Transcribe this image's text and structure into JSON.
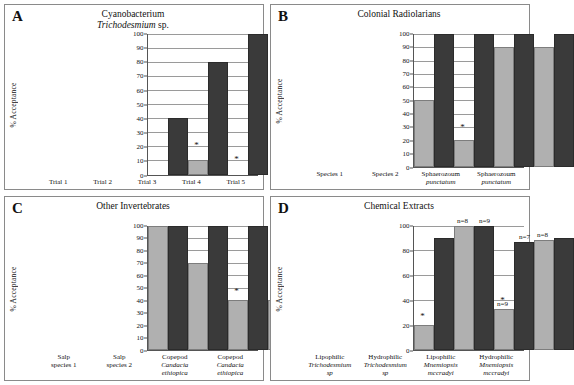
{
  "figure": {
    "panels": [
      {
        "letter": "A",
        "title_line1": "Cyanobacterium",
        "title_line2_italic": "Trichodesmium",
        "title_line2_rest": " sp.",
        "ylabel": "% Acceptance",
        "yticks": [
          0,
          10,
          20,
          30,
          40,
          50,
          60,
          70,
          80,
          90,
          100
        ],
        "categories": [
          "Trial 1",
          "Trial 2",
          "Trial 3",
          "Trial 4",
          "Trial 5"
        ],
        "light_values": [
          0,
          10,
          0,
          0,
          0
        ],
        "dark_values": [
          40,
          80,
          100,
          100,
          100
        ],
        "star_on_light": [
          false,
          true,
          true,
          true,
          true
        ],
        "star_heights": [
          0,
          18,
          8,
          8,
          8
        ]
      },
      {
        "letter": "B",
        "title_line1": "Colonial Radiolarians",
        "title_line2_italic": "",
        "title_line2_rest": "",
        "ylabel": "% Acceptance",
        "yticks": [
          0,
          10,
          20,
          30,
          40,
          50,
          60,
          70,
          80,
          90,
          100
        ],
        "categories": [
          "Species 1",
          "Species 2",
          "Sphaerozoum punctatum",
          "Sphaerozoum punctatum"
        ],
        "cat_lines": [
          {
            "l1": "Species 1",
            "l2": "",
            "italic": false
          },
          {
            "l1": "Species 2",
            "l2": "",
            "italic": false
          },
          {
            "l1": "Sphaerozoum",
            "l2": "punctatum",
            "italic": true
          },
          {
            "l1": "Sphaerozoum",
            "l2": "punctatum",
            "italic": true
          }
        ],
        "light_values": [
          50,
          20,
          90,
          90
        ],
        "dark_values": [
          100,
          100,
          100,
          100
        ],
        "star_on_light": [
          false,
          true,
          false,
          false
        ],
        "star_heights": [
          0,
          27,
          0,
          0
        ]
      },
      {
        "letter": "C",
        "title_line1": "Other Invertebrates",
        "title_line2_italic": "",
        "title_line2_rest": "",
        "ylabel": "% Acceptance",
        "yticks": [
          0,
          10,
          20,
          30,
          40,
          50,
          60,
          70,
          80,
          90,
          100
        ],
        "categories": [
          "Salp species 1",
          "Salp species 2",
          "Copepod Candacia ethiopica",
          "Copepod Candacia ethiopica"
        ],
        "cat_lines": [
          {
            "l1": "Salp",
            "l2": "species 1",
            "l3": "",
            "italic": false
          },
          {
            "l1": "Salp",
            "l2": "species 2",
            "l3": "",
            "italic": false
          },
          {
            "l1": "Copepod",
            "l2": "Candacia",
            "l3": "ethiopica",
            "italic": true
          },
          {
            "l1": "Copepod",
            "l2": "Candacia",
            "l3": "ethiopica",
            "italic": true
          }
        ],
        "light_values": [
          100,
          70,
          40,
          40
        ],
        "dark_values": [
          100,
          100,
          100,
          80
        ],
        "star_on_light": [
          false,
          false,
          true,
          true
        ],
        "star_heights": [
          0,
          0,
          44,
          44
        ]
      },
      {
        "letter": "D",
        "title_line1": "Chemical Extracts",
        "title_line2_italic": "",
        "title_line2_rest": "",
        "ylabel": "% Acceptance",
        "yticks": [
          0,
          20,
          40,
          60,
          80,
          100
        ],
        "categories": [
          "Lipophilic Trichodesmium sp",
          "Hydrophilic Trichodesmium sp",
          "Lipophilic Mnemiopsis mccradyi",
          "Hydrophilic Mnemiopsis mccradyi"
        ],
        "cat_lines": [
          {
            "l1": "Lipophilic",
            "l2": "Trichodesmium",
            "l3": "sp",
            "italic": true
          },
          {
            "l1": "Hydrophilic",
            "l2": "Trichodesmium",
            "l3": "sp",
            "italic": true
          },
          {
            "l1": "Lipophilic",
            "l2": "Mnemiopsis",
            "l3": "mccradyi",
            "italic": true
          },
          {
            "l1": "Hydrophilic",
            "l2": "Mnemiopsis",
            "l3": "mccradyi",
            "italic": true
          }
        ],
        "light_values": [
          20,
          100,
          33,
          88
        ],
        "dark_values": [
          90,
          100,
          87,
          90
        ],
        "star_on_light": [
          true,
          false,
          true,
          false
        ],
        "star_heights": [
          24,
          0,
          37,
          0
        ],
        "n_light": [
          "",
          "n=8",
          "n=9",
          "n=8"
        ],
        "n_dark": [
          "",
          "n=9",
          "n=7",
          ""
        ]
      }
    ],
    "colors": {
      "light_bar": "#b0b0b0",
      "dark_bar": "#3a3a3a",
      "gridline": "#9a9a9a",
      "axis": "#555555",
      "panel_border": "#8a8a8a",
      "background": "#ffffff"
    },
    "symbols": {
      "significance_marker": "*"
    }
  },
  "chart_data": [
    {
      "type": "bar",
      "title": "A — Cyanobacterium Trichodesmium sp.",
      "xlabel": "",
      "ylabel": "% Acceptance",
      "ylim": [
        0,
        100
      ],
      "yticks": [
        0,
        10,
        20,
        30,
        40,
        50,
        60,
        70,
        80,
        90,
        100
      ],
      "grid": true,
      "legend": "none",
      "categories": [
        "Trial 1",
        "Trial 2",
        "Trial 3",
        "Trial 4",
        "Trial 5"
      ],
      "series": [
        {
          "name": "light-gray bar",
          "values": [
            0,
            10,
            0,
            0,
            0
          ]
        },
        {
          "name": "dark bar",
          "values": [
            40,
            80,
            100,
            100,
            100
          ]
        }
      ],
      "annotations": [
        {
          "category": "Trial 2",
          "text": "*",
          "y": 18
        },
        {
          "category": "Trial 3",
          "text": "*",
          "y": 8
        },
        {
          "category": "Trial 4",
          "text": "*",
          "y": 8
        },
        {
          "category": "Trial 5",
          "text": "*",
          "y": 8
        }
      ]
    },
    {
      "type": "bar",
      "title": "B — Colonial Radiolarians",
      "xlabel": "",
      "ylabel": "% Acceptance",
      "ylim": [
        0,
        100
      ],
      "yticks": [
        0,
        10,
        20,
        30,
        40,
        50,
        60,
        70,
        80,
        90,
        100
      ],
      "grid": true,
      "legend": "none",
      "categories": [
        "Species 1",
        "Species 2",
        "Sphaerozoum punctatum",
        "Sphaerozoum punctatum"
      ],
      "series": [
        {
          "name": "light-gray bar",
          "values": [
            50,
            20,
            90,
            90
          ]
        },
        {
          "name": "dark bar",
          "values": [
            100,
            100,
            100,
            100
          ]
        }
      ],
      "annotations": [
        {
          "category": "Species 2",
          "text": "*",
          "y": 27
        }
      ]
    },
    {
      "type": "bar",
      "title": "C — Other Invertebrates",
      "xlabel": "",
      "ylabel": "% Acceptance",
      "ylim": [
        0,
        100
      ],
      "yticks": [
        0,
        10,
        20,
        30,
        40,
        50,
        60,
        70,
        80,
        90,
        100
      ],
      "grid": true,
      "legend": "none",
      "categories": [
        "Salp species 1",
        "Salp species 2",
        "Copepod Candacia ethiopica",
        "Copepod Candacia ethiopica"
      ],
      "series": [
        {
          "name": "light-gray bar",
          "values": [
            100,
            70,
            40,
            40
          ]
        },
        {
          "name": "dark bar",
          "values": [
            100,
            100,
            100,
            80
          ]
        }
      ],
      "annotations": [
        {
          "category": "Copepod Candacia ethiopica",
          "text": "*",
          "y": 44
        },
        {
          "category": "Copepod Candacia ethiopica",
          "text": "*",
          "y": 44
        }
      ]
    },
    {
      "type": "bar",
      "title": "D — Chemical Extracts",
      "xlabel": "",
      "ylabel": "% Acceptance",
      "ylim": [
        0,
        100
      ],
      "yticks": [
        0,
        20,
        40,
        60,
        80,
        100
      ],
      "grid": true,
      "legend": "none",
      "categories": [
        "Lipophilic Trichodesmium sp",
        "Hydrophilic Trichodesmium sp",
        "Lipophilic Mnemiopsis mccradyi",
        "Hydrophilic Mnemiopsis mccradyi"
      ],
      "series": [
        {
          "name": "light-gray bar",
          "values": [
            20,
            100,
            33,
            88
          ]
        },
        {
          "name": "dark bar",
          "values": [
            90,
            100,
            87,
            90
          ]
        }
      ],
      "annotations": [
        {
          "category": "Lipophilic Trichodesmium sp",
          "text": "*",
          "y": 24
        },
        {
          "category": "Hydrophilic Trichodesmium sp",
          "text": "n=8",
          "y": 100
        },
        {
          "category": "Hydrophilic Trichodesmium sp",
          "text": "n=9",
          "y": 100
        },
        {
          "category": "Lipophilic Mnemiopsis mccradyi",
          "text": "n=9",
          "y": 42
        },
        {
          "category": "Lipophilic Mnemiopsis mccradyi",
          "text": "*",
          "y": 37
        },
        {
          "category": "Lipophilic Mnemiopsis mccradyi",
          "text": "n=7",
          "y": 90
        },
        {
          "category": "Hydrophilic Mnemiopsis mccradyi",
          "text": "n=8",
          "y": 94
        }
      ]
    }
  ]
}
